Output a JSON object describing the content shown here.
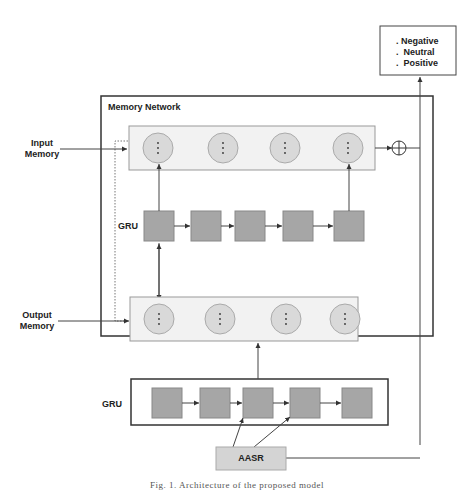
{
  "diagram": {
    "output_box": {
      "items": [
        "Negative",
        "Neutral",
        "Positive"
      ],
      "bullet": "."
    },
    "memory_network": {
      "title": "Memory Network",
      "input_memory_label": "Input Memory",
      "output_memory_label": "Output Memory",
      "inner_gru_label": "GRU",
      "input_memory_cells": 4,
      "output_memory_cells": 4,
      "inner_gru_cells": 5,
      "sum_symbol": "⊕"
    },
    "outer_gru": {
      "label": "GRU",
      "cells": 5
    },
    "aasr": {
      "label": "AASR"
    },
    "caption": "Fig. 1. Architecture of the proposed model",
    "colors": {
      "cell_fill": "#a6a6a6",
      "circle_fill": "#d9d9d9",
      "memory_bar_fill": "#f2f2f2",
      "aasr_fill": "#d4d4d4",
      "line": "#444444"
    }
  }
}
